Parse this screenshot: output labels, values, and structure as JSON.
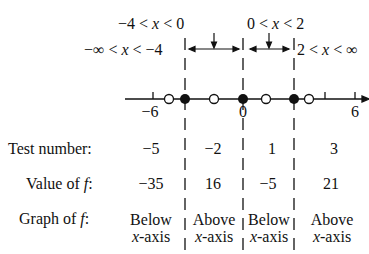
{
  "intervals": [
    {
      "label_pre": "−∞ < ",
      "var": "x",
      "label_post": " < −4",
      "test": "−5",
      "value": "−35",
      "graph_line1": "Below",
      "graph_line2_var": "x",
      "graph_line2_post": "-axis"
    },
    {
      "label_pre": "−4 < ",
      "var": "x",
      "label_post": " < 0",
      "test": "−2",
      "value": "16",
      "graph_line1": "Above",
      "graph_line2_var": "x",
      "graph_line2_post": "-axis"
    },
    {
      "label_pre": "0 < ",
      "var": "x",
      "label_post": " < 2",
      "test": "1",
      "value": "−5",
      "graph_line1": "Below",
      "graph_line2_var": "x",
      "graph_line2_post": "-axis"
    },
    {
      "label_pre": "2 < ",
      "var": "x",
      "label_post": " < ∞",
      "test": "3",
      "value": "21",
      "graph_line1": "Above",
      "graph_line2_var": "x",
      "graph_line2_post": "-axis"
    }
  ],
  "row_labels": {
    "test": "Test number:",
    "value_pre": "Value of ",
    "value_var": "f",
    "value_post": ":",
    "graph_pre": "Graph of ",
    "graph_var": "f",
    "graph_post": ":"
  },
  "number_line": {
    "tick_labels": [
      "−6",
      "0",
      "6"
    ],
    "zeros": [
      -4,
      0,
      2
    ],
    "test_points": [
      -5,
      -2,
      1,
      3
    ]
  }
}
